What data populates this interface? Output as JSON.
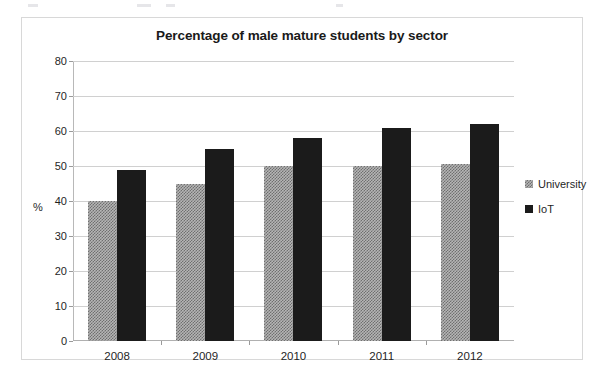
{
  "chart_data": {
    "type": "bar",
    "title": "Percentage of male mature students by sector",
    "xlabel": "",
    "ylabel": "%",
    "categories": [
      "2008",
      "2009",
      "2010",
      "2011",
      "2012"
    ],
    "series": [
      {
        "name": "University",
        "values": [
          40,
          45,
          50,
          50,
          50.5
        ],
        "color": "#b5b5b5",
        "fill": "hatched"
      },
      {
        "name": "IoT",
        "values": [
          49,
          55,
          58,
          61,
          62
        ],
        "color": "#1b1b1b",
        "fill": "solid"
      }
    ],
    "ylim": [
      0,
      80
    ],
    "y_ticks": [
      "0",
      "10",
      "20",
      "30",
      "40",
      "50",
      "60",
      "70",
      "80"
    ],
    "grid": true,
    "legend_position": "right"
  },
  "legend": {
    "items": [
      {
        "label": "University"
      },
      {
        "label": "IoT"
      }
    ]
  }
}
